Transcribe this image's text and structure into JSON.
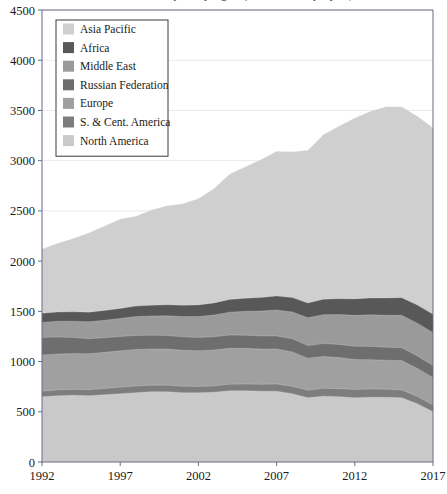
{
  "chart_data": {
    "type": "area",
    "stacked": true,
    "title": "Oil consumption by region (million tonnes per year)",
    "xlabel": "",
    "ylabel": "",
    "xlim": [
      1992,
      2017
    ],
    "ylim": [
      0,
      4500
    ],
    "ytick_values": [
      0,
      500,
      1000,
      1500,
      2000,
      2500,
      3000,
      3500,
      4000,
      4500
    ],
    "ytick_labels": [
      "0",
      "500",
      "1000",
      "1500",
      "2000",
      "2500",
      "3000",
      "3500",
      "4000",
      "4500"
    ],
    "xtick_values": [
      1992,
      1997,
      2002,
      2007,
      2012,
      2017
    ],
    "xtick_labels": [
      "1992",
      "1997",
      "2002",
      "2007",
      "2012",
      "2017"
    ],
    "grid": true,
    "legend_position": "top-left",
    "x": [
      1992,
      1993,
      1994,
      1995,
      1996,
      1997,
      1998,
      1999,
      2000,
      2001,
      2002,
      2003,
      2004,
      2005,
      2006,
      2007,
      2008,
      2009,
      2010,
      2011,
      2012,
      2013,
      2014,
      2015,
      2016,
      2017
    ],
    "series": [
      {
        "name": "North America",
        "color": "#c9c9c9",
        "values": [
          650,
          660,
          665,
          660,
          670,
          680,
          690,
          700,
          700,
          690,
          690,
          695,
          710,
          710,
          705,
          705,
          680,
          640,
          655,
          650,
          640,
          645,
          645,
          640,
          580,
          500
        ]
      },
      {
        "name": "S. & Cent. America",
        "color": "#7d7d7d",
        "values": [
          55,
          57,
          58,
          60,
          62,
          65,
          66,
          64,
          65,
          64,
          62,
          62,
          64,
          66,
          68,
          72,
          74,
          74,
          78,
          80,
          82,
          82,
          80,
          78,
          72,
          68
        ]
      },
      {
        "name": "Europe",
        "color": "#a0a0a0",
        "values": [
          360,
          358,
          356,
          358,
          360,
          362,
          364,
          362,
          360,
          358,
          356,
          358,
          358,
          356,
          352,
          348,
          342,
          320,
          318,
          310,
          298,
          292,
          288,
          292,
          280,
          272
        ]
      },
      {
        "name": "Russian Federation",
        "color": "#6e6e6e",
        "values": [
          175,
          170,
          160,
          150,
          145,
          142,
          140,
          136,
          134,
          134,
          132,
          132,
          132,
          130,
          130,
          130,
          130,
          125,
          128,
          130,
          132,
          132,
          130,
          128,
          124,
          120
        ]
      },
      {
        "name": "Middle East",
        "color": "#9a9a9a",
        "values": [
          150,
          156,
          162,
          168,
          174,
          180,
          188,
          192,
          196,
          202,
          208,
          216,
          228,
          238,
          248,
          258,
          268,
          276,
          288,
          298,
          308,
          314,
          318,
          322,
          326,
          328
        ]
      },
      {
        "name": "Africa",
        "color": "#585858",
        "values": [
          90,
          92,
          94,
          96,
          98,
          100,
          104,
          106,
          110,
          112,
          116,
          120,
          126,
          130,
          134,
          140,
          144,
          148,
          154,
          158,
          164,
          168,
          172,
          176,
          180,
          184
        ]
      },
      {
        "name": "Asia Pacific",
        "color": "#cfcfcf",
        "values": [
          640,
          685,
          730,
          790,
          840,
          890,
          895,
          950,
          985,
          1010,
          1060,
          1140,
          1250,
          1310,
          1375,
          1440,
          1450,
          1520,
          1640,
          1720,
          1800,
          1860,
          1905,
          1900,
          1880,
          1855
        ]
      }
    ]
  },
  "legend": {
    "items": [
      {
        "label": "Asia Pacific",
        "color": "#cfcfcf"
      },
      {
        "label": "Africa",
        "color": "#585858"
      },
      {
        "label": "Middle East",
        "color": "#9a9a9a"
      },
      {
        "label": "Russian Federation",
        "color": "#6e6e6e"
      },
      {
        "label": "Europe",
        "color": "#a0a0a0"
      },
      {
        "label": "S. & Cent. America",
        "color": "#7d7d7d"
      },
      {
        "label": "North America",
        "color": "#c9c9c9"
      }
    ]
  }
}
